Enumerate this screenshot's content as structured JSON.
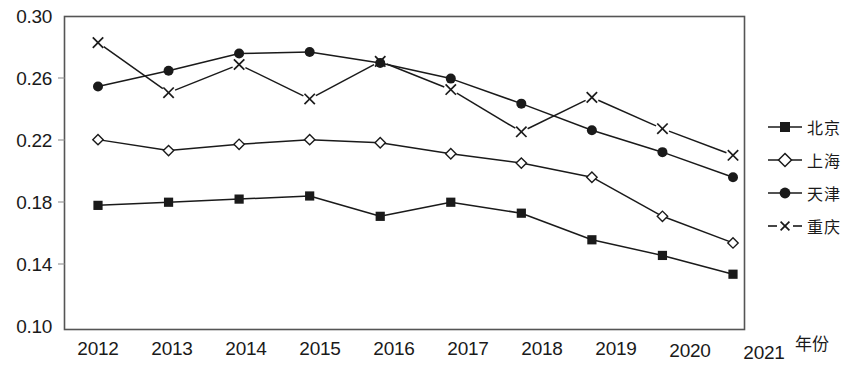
{
  "chart_data": {
    "type": "line",
    "title": "",
    "xlabel": "年份",
    "ylabel": "",
    "x": [
      "2012",
      "2013",
      "2014",
      "2015",
      "2016",
      "2017",
      "2018",
      "2019",
      "2020",
      "2021"
    ],
    "ylim": [
      0.1,
      0.3
    ],
    "yticks": [
      "0.10",
      "0.14",
      "0.18",
      "0.22",
      "0.26",
      "0.30"
    ],
    "ytick_values": [
      0.1,
      0.14,
      0.18,
      0.22,
      0.26,
      0.3
    ],
    "grid": false,
    "legend_position": "right",
    "series": [
      {
        "name": "北京",
        "marker": "filled-square",
        "line_style": "solid",
        "color": "#1a1a1a",
        "values": [
          0.179,
          0.181,
          0.183,
          0.185,
          0.172,
          0.181,
          0.174,
          0.157,
          0.147,
          0.135
        ]
      },
      {
        "name": "上海",
        "marker": "open-diamond",
        "line_style": "solid",
        "color": "#1a1a1a",
        "values": [
          0.221,
          0.214,
          0.218,
          0.221,
          0.219,
          0.212,
          0.206,
          0.197,
          0.172,
          0.155
        ]
      },
      {
        "name": "天津",
        "marker": "filled-circle",
        "line_style": "solid",
        "color": "#1a1a1a",
        "values": [
          0.255,
          0.265,
          0.276,
          0.277,
          0.27,
          0.26,
          0.244,
          0.227,
          0.213,
          0.197
        ]
      },
      {
        "name": "重庆",
        "marker": "cross-x",
        "line_style": "dashed",
        "color": "#1a1a1a",
        "values": [
          0.283,
          0.251,
          0.269,
          0.247,
          0.271,
          0.253,
          0.226,
          0.248,
          0.228,
          0.211
        ]
      }
    ]
  },
  "legend": {
    "items": [
      {
        "label": "北京",
        "marker": "filled-square",
        "dashed": false
      },
      {
        "label": "上海",
        "marker": "open-diamond",
        "dashed": false
      },
      {
        "label": "天津",
        "marker": "filled-circle",
        "dashed": false
      },
      {
        "label": "重庆",
        "marker": "cross-x",
        "dashed": true
      }
    ]
  },
  "axis": {
    "x_title": "年份"
  }
}
